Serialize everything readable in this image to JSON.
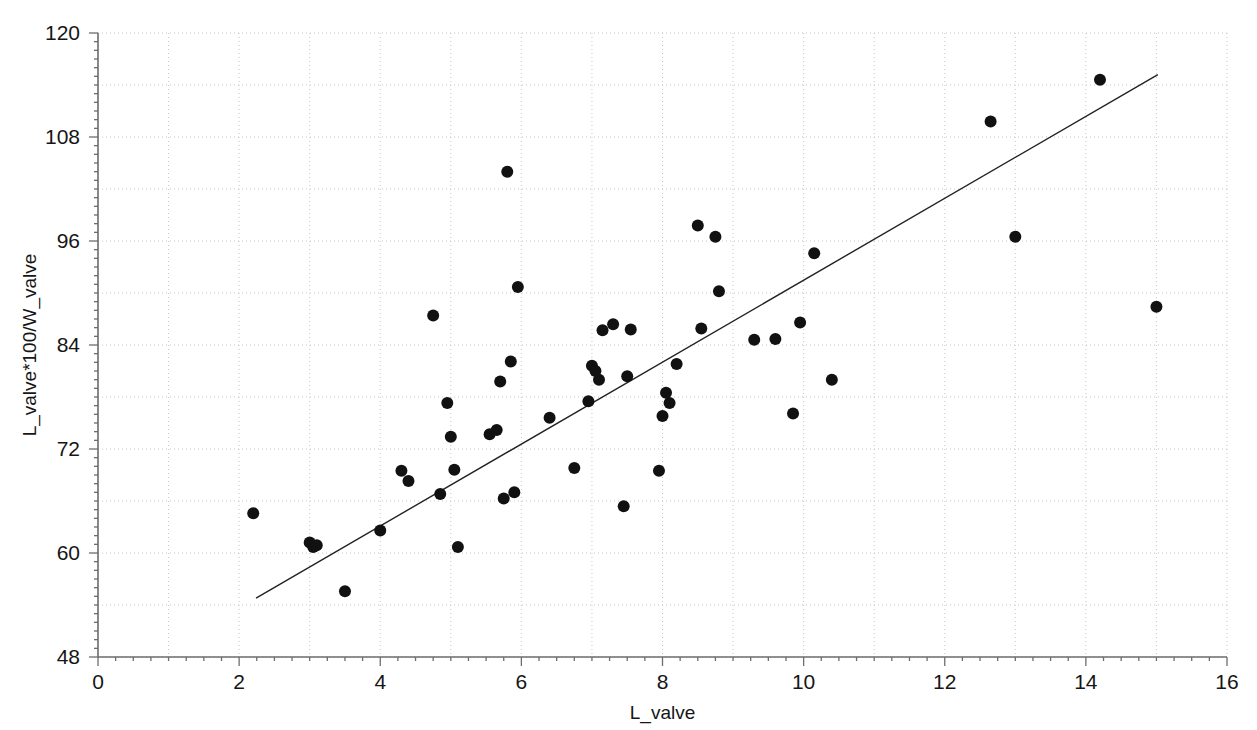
{
  "chart_data": {
    "type": "scatter",
    "title": "",
    "xlabel": "L_valve",
    "ylabel": "L_valve*100/W_valve",
    "xlim": [
      0,
      16
    ],
    "ylim": [
      48,
      120
    ],
    "xticks": [
      0,
      2,
      4,
      6,
      8,
      10,
      12,
      14,
      16
    ],
    "yticks": [
      48,
      60,
      72,
      84,
      96,
      108,
      120
    ],
    "xtick_labels": [
      "0",
      "2",
      "4",
      "6",
      "8",
      "10",
      "12",
      "14",
      "16"
    ],
    "ytick_labels": [
      "48",
      "60",
      "72",
      "84",
      "96",
      "108",
      "120"
    ],
    "x_minor_step": 1,
    "y_minor_step": 6,
    "grid": true,
    "grid_style": "dotted",
    "grid_color": "#c8c8c8",
    "legend": "none",
    "marker": {
      "shape": "circle",
      "color": "#111111",
      "size": 7
    },
    "trendline": {
      "type": "linear",
      "color": "#222222",
      "width": 1.4,
      "x_start": 2.24,
      "y_start": 54.8,
      "x_end": 15.02,
      "y_end": 115.2,
      "slope": 4.73,
      "intercept": 44.2
    },
    "points": [
      {
        "x": 2.2,
        "y": 64.6
      },
      {
        "x": 3.0,
        "y": 61.2
      },
      {
        "x": 3.05,
        "y": 60.7
      },
      {
        "x": 3.1,
        "y": 60.9
      },
      {
        "x": 3.5,
        "y": 55.6
      },
      {
        "x": 4.0,
        "y": 62.6
      },
      {
        "x": 4.3,
        "y": 69.5
      },
      {
        "x": 4.4,
        "y": 68.3
      },
      {
        "x": 4.75,
        "y": 87.4
      },
      {
        "x": 4.85,
        "y": 66.8
      },
      {
        "x": 4.95,
        "y": 77.3
      },
      {
        "x": 5.0,
        "y": 73.4
      },
      {
        "x": 5.05,
        "y": 69.6
      },
      {
        "x": 5.1,
        "y": 60.7
      },
      {
        "x": 5.55,
        "y": 73.7
      },
      {
        "x": 5.65,
        "y": 74.2
      },
      {
        "x": 5.7,
        "y": 79.8
      },
      {
        "x": 5.75,
        "y": 66.3
      },
      {
        "x": 5.8,
        "y": 104.0
      },
      {
        "x": 5.85,
        "y": 82.1
      },
      {
        "x": 5.9,
        "y": 67.0
      },
      {
        "x": 5.95,
        "y": 90.7
      },
      {
        "x": 6.4,
        "y": 75.6
      },
      {
        "x": 6.75,
        "y": 69.8
      },
      {
        "x": 6.95,
        "y": 77.5
      },
      {
        "x": 7.0,
        "y": 81.6
      },
      {
        "x": 7.05,
        "y": 81.0
      },
      {
        "x": 7.1,
        "y": 80.0
      },
      {
        "x": 7.15,
        "y": 85.7
      },
      {
        "x": 7.3,
        "y": 86.4
      },
      {
        "x": 7.45,
        "y": 65.4
      },
      {
        "x": 7.5,
        "y": 80.4
      },
      {
        "x": 7.55,
        "y": 85.8
      },
      {
        "x": 7.95,
        "y": 69.5
      },
      {
        "x": 8.0,
        "y": 75.8
      },
      {
        "x": 8.05,
        "y": 78.5
      },
      {
        "x": 8.1,
        "y": 77.3
      },
      {
        "x": 8.2,
        "y": 81.8
      },
      {
        "x": 8.5,
        "y": 97.8
      },
      {
        "x": 8.55,
        "y": 85.9
      },
      {
        "x": 8.75,
        "y": 96.5
      },
      {
        "x": 8.8,
        "y": 90.2
      },
      {
        "x": 9.3,
        "y": 84.6
      },
      {
        "x": 9.6,
        "y": 84.7
      },
      {
        "x": 9.85,
        "y": 76.1
      },
      {
        "x": 9.95,
        "y": 86.6
      },
      {
        "x": 10.15,
        "y": 94.6
      },
      {
        "x": 10.4,
        "y": 80.0
      },
      {
        "x": 12.65,
        "y": 109.8
      },
      {
        "x": 13.0,
        "y": 96.5
      },
      {
        "x": 14.2,
        "y": 114.6
      },
      {
        "x": 15.0,
        "y": 88.4
      }
    ]
  },
  "geometry": {
    "plot_left": 98,
    "plot_right": 1227,
    "plot_top": 33,
    "plot_bottom": 657
  }
}
